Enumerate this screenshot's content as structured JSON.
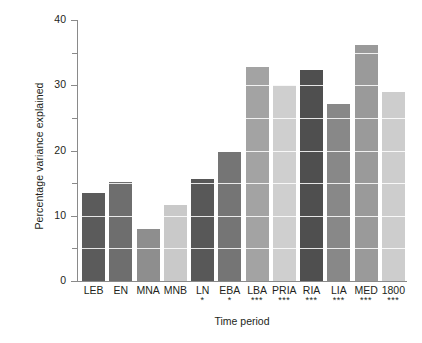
{
  "chart_data": {
    "type": "bar",
    "title": "",
    "xlabel": "Time period",
    "ylabel": "Percentage variance explained",
    "categories": [
      "LEB",
      "EN",
      "MNA",
      "MNB",
      "LN",
      "EBA",
      "LBA",
      "PRIA",
      "RIA",
      "LIA",
      "MED",
      "1800"
    ],
    "values": [
      13.5,
      15.2,
      8.0,
      11.6,
      15.7,
      19.8,
      32.8,
      30.0,
      32.4,
      27.2,
      36.2,
      29.0
    ],
    "significance": [
      "",
      "",
      "",
      "",
      "*",
      "*",
      "***",
      "***",
      "***",
      "***",
      "***",
      "***"
    ],
    "bar_colors": [
      "#5b5b5b",
      "#6e6e6e",
      "#8e8e8e",
      "#c9c9c9",
      "#585858",
      "#757575",
      "#a3a3a3",
      "#cfcfcf",
      "#4f4f4f",
      "#888888",
      "#9a9a9a",
      "#cdcdcd"
    ],
    "ylim": [
      0,
      40
    ],
    "yticks": [
      0,
      10,
      20,
      30,
      40
    ],
    "ytick_labels": [
      "0",
      "10",
      "20",
      "30",
      "40"
    ],
    "yticks_minor": [
      5,
      15,
      25,
      35
    ],
    "grid": true,
    "grid_color": "#ffffff",
    "legend": "none",
    "axis_color": "#8a8a8a",
    "text_color": "#231f20",
    "background": "#ffffff"
  }
}
